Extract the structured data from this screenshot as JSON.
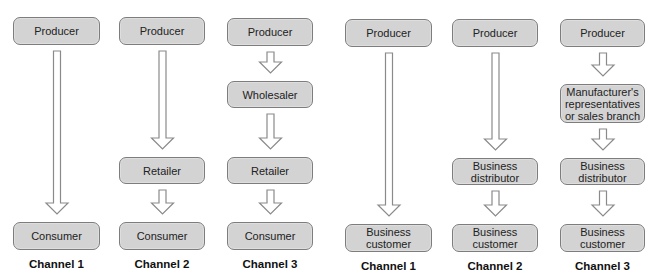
{
  "diagram": {
    "groups": [
      {
        "name": "consumer-channels",
        "channels": [
          {
            "label": "Channel 1",
            "x": 13,
            "width": 87,
            "nodes": [
              {
                "text": "Producer",
                "y": 17,
                "h": 28
              },
              {
                "text": "Consumer",
                "y": 222,
                "h": 28
              }
            ]
          },
          {
            "label": "Channel 2",
            "x": 119,
            "width": 86,
            "nodes": [
              {
                "text": "Producer",
                "y": 17,
                "h": 28
              },
              {
                "text": "Retailer",
                "y": 157,
                "h": 27
              },
              {
                "text": "Consumer",
                "y": 222,
                "h": 28
              }
            ]
          },
          {
            "label": "Channel 3",
            "x": 227,
            "width": 86,
            "nodes": [
              {
                "text": "Producer",
                "y": 18,
                "h": 28
              },
              {
                "text": "Wholesaler",
                "y": 81,
                "h": 27
              },
              {
                "text": "Retailer",
                "y": 157,
                "h": 27
              },
              {
                "text": "Consumer",
                "y": 222,
                "h": 28
              }
            ]
          }
        ]
      },
      {
        "name": "business-channels",
        "channels": [
          {
            "label": "Channel 1",
            "x": 345,
            "width": 87,
            "nodes": [
              {
                "text": "Producer",
                "y": 19,
                "h": 28
              },
              {
                "text": "Business\ncustomer",
                "y": 224,
                "h": 28
              }
            ]
          },
          {
            "label": "Channel 2",
            "x": 452,
            "width": 86,
            "nodes": [
              {
                "text": "Producer",
                "y": 19,
                "h": 28
              },
              {
                "text": "Business\ndistributor",
                "y": 158,
                "h": 27
              },
              {
                "text": "Business\ncustomer",
                "y": 224,
                "h": 28
              }
            ]
          },
          {
            "label": "Channel 3",
            "x": 560,
            "width": 85,
            "nodes": [
              {
                "text": "Producer",
                "y": 19,
                "h": 28
              },
              {
                "text": "Manufacturer's\nrepresentatives\nor sales branch",
                "y": 84,
                "h": 39
              },
              {
                "text": "Business\ndistributor",
                "y": 158,
                "h": 27
              },
              {
                "text": "Business\ncustomer",
                "y": 224,
                "h": 28
              }
            ]
          }
        ]
      }
    ],
    "label_y": 259,
    "colors": {
      "node_fill": "#d3d3d3",
      "node_border": "#7d7d7d",
      "arrow_fill": "#ffffff",
      "arrow_stroke": "#8a8a8a"
    }
  }
}
